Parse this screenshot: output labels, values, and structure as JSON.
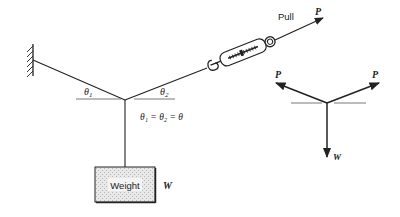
{
  "diagram": {
    "labels": {
      "pull": "Pull",
      "pull_force": "P",
      "theta1": "θ",
      "theta1_sub": "1",
      "theta2": "θ",
      "theta2_sub": "2",
      "equation": "θ₁ = θ₂ = θ",
      "weight_box": "Weight",
      "weight_symbol": "W"
    },
    "free_body": {
      "left_force": "P",
      "right_force": "P",
      "down_force": "W"
    },
    "colors": {
      "line": "#222222",
      "weight_fill": "#dcdcdc",
      "background": "#ffffff"
    }
  }
}
